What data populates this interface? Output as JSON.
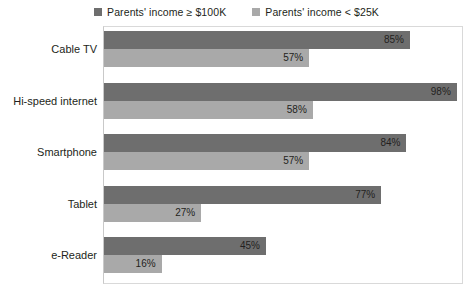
{
  "legend": {
    "entries": [
      {
        "label": "Parents' income ≥ $100K",
        "color": "#6e6e6e",
        "swatch_name": "legend-swatch-high-income"
      },
      {
        "label": "Parents' income < $25K",
        "color": "#a9a9a9",
        "swatch_name": "legend-swatch-low-income"
      }
    ]
  },
  "chart_data": {
    "type": "bar",
    "orientation": "horizontal",
    "title": "",
    "subtitle": "",
    "xlabel": "",
    "ylabel": "",
    "xlim": [
      0,
      100
    ],
    "grid": false,
    "legend_position": "top-center",
    "categories": [
      "Cable TV",
      "Hi-speed internet",
      "Smartphone",
      "Tablet",
      "e-Reader"
    ],
    "series": [
      {
        "name": "Parents' income ≥ $100K",
        "color": "#6e6e6e",
        "values": [
          85,
          98,
          84,
          77,
          45
        ],
        "labels": [
          "85%",
          "98%",
          "84%",
          "77%",
          "45%"
        ]
      },
      {
        "name": "Parents' income < $25K",
        "color": "#a9a9a9",
        "values": [
          57,
          58,
          57,
          27,
          16
        ],
        "labels": [
          "57%",
          "58%",
          "57%",
          "27%",
          "16%"
        ]
      }
    ]
  },
  "colors": {
    "high_income_bar": "#6e6e6e",
    "low_income_bar": "#a9a9a9",
    "frame_border": "#d9d9d9",
    "text": "#231f20",
    "background": "#ffffff"
  }
}
